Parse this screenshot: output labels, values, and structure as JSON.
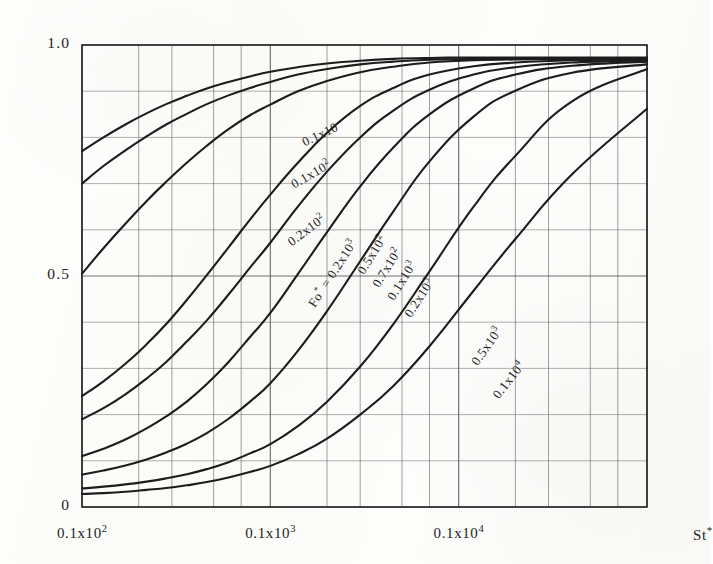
{
  "figure": {
    "kind": "scanned-engineering-chart",
    "ink_color": "#1c1c1c",
    "grid_color": "#5a5a5a",
    "paper_color": "#fdfdfb"
  },
  "axes": {
    "y": {
      "label": "",
      "min": 0,
      "max": 1.0,
      "scale": "linear",
      "major_ticks": [
        {
          "value": 1.0,
          "text": "1.0"
        },
        {
          "value": 0.5,
          "text": "0.5"
        },
        {
          "value": 0.0,
          "text": "0"
        }
      ],
      "minor_tick_step": 0.1
    },
    "x": {
      "label_text": "St",
      "label_star": "*",
      "min": 10,
      "max": 10000,
      "scale": "log",
      "major_ticks": [
        {
          "value": 10,
          "mantissa": "0.1x10",
          "exp": "2"
        },
        {
          "value": 100,
          "mantissa": "0.1x10",
          "exp": "3"
        },
        {
          "value": 1000,
          "mantissa": "0.1x10",
          "exp": "4"
        }
      ]
    }
  },
  "annotation": {
    "family_label_prefix": "Fo",
    "family_label_star": "*",
    "family_label_eq": " = 0.2x10",
    "family_label_exp": "3"
  },
  "chart_data": {
    "type": "line",
    "title": "",
    "subtitle": "",
    "xlabel": "St*",
    "ylabel": "",
    "xscale": "log",
    "yscale": "linear",
    "xlim": [
      10,
      10000
    ],
    "ylim": [
      0,
      1.0
    ],
    "grid": true,
    "legend": "inline-curve-labels",
    "parameter_name": "Fo*",
    "series": [
      {
        "name": "0.1x10",
        "label_mantissa": "0.1x10",
        "label_exp": "",
        "label_x": 150,
        "label_y": 0.805,
        "label_rot": -26,
        "points": [
          [
            10,
            0.77
          ],
          [
            13,
            0.8
          ],
          [
            17,
            0.828
          ],
          [
            22,
            0.852
          ],
          [
            28,
            0.872
          ],
          [
            36,
            0.89
          ],
          [
            46,
            0.906
          ],
          [
            60,
            0.92
          ],
          [
            78,
            0.932
          ],
          [
            100,
            0.942
          ],
          [
            140,
            0.952
          ],
          [
            200,
            0.96
          ],
          [
            300,
            0.966
          ],
          [
            450,
            0.97
          ],
          [
            700,
            0.972
          ],
          [
            1200,
            0.973
          ],
          [
            2500,
            0.973
          ],
          [
            5000,
            0.973
          ],
          [
            10000,
            0.973
          ]
        ]
      },
      {
        "name": "0.1x10^2",
        "label_mantissa": "0.1x10",
        "label_exp": "2",
        "label_x": 130,
        "label_y": 0.716,
        "label_rot": -30,
        "points": [
          [
            10,
            0.7
          ],
          [
            13,
            0.738
          ],
          [
            17,
            0.772
          ],
          [
            22,
            0.802
          ],
          [
            28,
            0.828
          ],
          [
            36,
            0.851
          ],
          [
            46,
            0.872
          ],
          [
            60,
            0.891
          ],
          [
            78,
            0.907
          ],
          [
            100,
            0.92
          ],
          [
            140,
            0.936
          ],
          [
            200,
            0.948
          ],
          [
            300,
            0.958
          ],
          [
            450,
            0.964
          ],
          [
            700,
            0.968
          ],
          [
            1200,
            0.97
          ],
          [
            2500,
            0.971
          ],
          [
            5000,
            0.971
          ],
          [
            10000,
            0.971
          ]
        ]
      },
      {
        "name": "0.2x10^2",
        "label_mantissa": "0.2x10",
        "label_exp": "2",
        "label_x": 125,
        "label_y": 0.59,
        "label_rot": -37,
        "points": [
          [
            10,
            0.505
          ],
          [
            13,
            0.56
          ],
          [
            17,
            0.613
          ],
          [
            22,
            0.662
          ],
          [
            28,
            0.704
          ],
          [
            36,
            0.745
          ],
          [
            46,
            0.782
          ],
          [
            60,
            0.818
          ],
          [
            78,
            0.848
          ],
          [
            100,
            0.871
          ],
          [
            140,
            0.9
          ],
          [
            200,
            0.922
          ],
          [
            300,
            0.941
          ],
          [
            450,
            0.953
          ],
          [
            700,
            0.962
          ],
          [
            1200,
            0.967
          ],
          [
            2500,
            0.969
          ],
          [
            5000,
            0.97
          ],
          [
            10000,
            0.97
          ]
        ]
      },
      {
        "name": "0.5x10^2",
        "label_mantissa": "0.5x10",
        "label_exp": "2",
        "label_x": 300,
        "label_y": 0.525,
        "label_rot": -58,
        "points": [
          [
            10,
            0.24
          ],
          [
            13,
            0.272
          ],
          [
            17,
            0.31
          ],
          [
            22,
            0.352
          ],
          [
            28,
            0.396
          ],
          [
            36,
            0.448
          ],
          [
            46,
            0.502
          ],
          [
            60,
            0.562
          ],
          [
            78,
            0.622
          ],
          [
            100,
            0.676
          ],
          [
            140,
            0.745
          ],
          [
            200,
            0.81
          ],
          [
            300,
            0.868
          ],
          [
            450,
            0.907
          ],
          [
            700,
            0.936
          ],
          [
            1200,
            0.954
          ],
          [
            2000,
            0.962
          ],
          [
            4000,
            0.967
          ],
          [
            10000,
            0.969
          ]
        ]
      },
      {
        "name": "0.7x10^2",
        "label_mantissa": "0.7x10",
        "label_exp": "2",
        "label_x": 360,
        "label_y": 0.498,
        "label_rot": -58,
        "points": [
          [
            10,
            0.19
          ],
          [
            13,
            0.214
          ],
          [
            17,
            0.244
          ],
          [
            22,
            0.278
          ],
          [
            28,
            0.314
          ],
          [
            36,
            0.358
          ],
          [
            46,
            0.404
          ],
          [
            60,
            0.46
          ],
          [
            78,
            0.518
          ],
          [
            100,
            0.572
          ],
          [
            140,
            0.65
          ],
          [
            200,
            0.726
          ],
          [
            300,
            0.8
          ],
          [
            450,
            0.858
          ],
          [
            700,
            0.903
          ],
          [
            1200,
            0.936
          ],
          [
            2000,
            0.952
          ],
          [
            4000,
            0.962
          ],
          [
            10000,
            0.967
          ]
        ]
      },
      {
        "name": "0.1x10^3",
        "label_mantissa": "0.1x10",
        "label_exp": "3",
        "label_x": 430,
        "label_y": 0.47,
        "label_rot": -58,
        "points": [
          [
            10,
            0.11
          ],
          [
            13,
            0.126
          ],
          [
            17,
            0.146
          ],
          [
            22,
            0.17
          ],
          [
            28,
            0.196
          ],
          [
            36,
            0.228
          ],
          [
            46,
            0.266
          ],
          [
            60,
            0.314
          ],
          [
            78,
            0.368
          ],
          [
            100,
            0.42
          ],
          [
            140,
            0.504
          ],
          [
            200,
            0.595
          ],
          [
            300,
            0.694
          ],
          [
            450,
            0.778
          ],
          [
            700,
            0.85
          ],
          [
            1200,
            0.906
          ],
          [
            2000,
            0.936
          ],
          [
            4000,
            0.955
          ],
          [
            10000,
            0.964
          ]
        ]
      },
      {
        "name": "0.2x10^3",
        "label_mantissa": "0.2x10",
        "label_exp": "3",
        "label_x": 530,
        "label_y": 0.432,
        "label_rot": -57,
        "points": [
          [
            10,
            0.07
          ],
          [
            13,
            0.079
          ],
          [
            17,
            0.09
          ],
          [
            22,
            0.103
          ],
          [
            28,
            0.118
          ],
          [
            36,
            0.137
          ],
          [
            46,
            0.16
          ],
          [
            60,
            0.191
          ],
          [
            78,
            0.228
          ],
          [
            100,
            0.268
          ],
          [
            140,
            0.338
          ],
          [
            200,
            0.424
          ],
          [
            300,
            0.532
          ],
          [
            450,
            0.64
          ],
          [
            700,
            0.748
          ],
          [
            1200,
            0.845
          ],
          [
            2000,
            0.901
          ],
          [
            4000,
            0.94
          ],
          [
            10000,
            0.958
          ]
        ]
      },
      {
        "name": "0.5x10^3",
        "label_mantissa": "0.5x10",
        "label_exp": "3",
        "label_x": 1200,
        "label_y": 0.33,
        "label_rot": -55,
        "points": [
          [
            10,
            0.04
          ],
          [
            13,
            0.044
          ],
          [
            17,
            0.049
          ],
          [
            22,
            0.055
          ],
          [
            28,
            0.062
          ],
          [
            36,
            0.071
          ],
          [
            46,
            0.082
          ],
          [
            60,
            0.097
          ],
          [
            78,
            0.116
          ],
          [
            100,
            0.136
          ],
          [
            140,
            0.175
          ],
          [
            200,
            0.228
          ],
          [
            300,
            0.304
          ],
          [
            450,
            0.396
          ],
          [
            700,
            0.51
          ],
          [
            1200,
            0.65
          ],
          [
            2000,
            0.76
          ],
          [
            4000,
            0.878
          ],
          [
            10000,
            0.948
          ]
        ]
      },
      {
        "name": "0.1x10^4",
        "label_mantissa": "0.1x10",
        "label_exp": "4",
        "label_x": 1550,
        "label_y": 0.258,
        "label_rot": -52,
        "points": [
          [
            10,
            0.028
          ],
          [
            13,
            0.03
          ],
          [
            17,
            0.033
          ],
          [
            22,
            0.037
          ],
          [
            28,
            0.041
          ],
          [
            36,
            0.047
          ],
          [
            46,
            0.054
          ],
          [
            60,
            0.064
          ],
          [
            78,
            0.076
          ],
          [
            100,
            0.089
          ],
          [
            140,
            0.114
          ],
          [
            200,
            0.148
          ],
          [
            300,
            0.2
          ],
          [
            450,
            0.262
          ],
          [
            700,
            0.348
          ],
          [
            1200,
            0.468
          ],
          [
            2000,
            0.58
          ],
          [
            4000,
            0.72
          ],
          [
            10000,
            0.862
          ]
        ]
      }
    ]
  }
}
